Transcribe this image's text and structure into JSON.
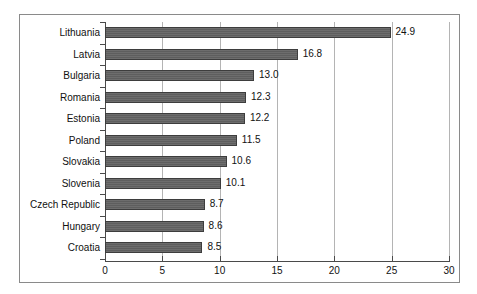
{
  "chart_data": {
    "type": "bar",
    "orientation": "horizontal",
    "title": "",
    "subtitle": "",
    "xlabel": "",
    "ylabel": "",
    "xlim": [
      0,
      30
    ],
    "xticks": [
      "0",
      "5",
      "10",
      "15",
      "20",
      "25",
      "30"
    ],
    "grid": true,
    "legend": null,
    "categories": [
      "Lithuania",
      "Latvia",
      "Bulgaria",
      "Romania",
      "Estonia",
      "Poland",
      "Slovakia",
      "Slovenia",
      "Czech Republic",
      "Hungary",
      "Croatia"
    ],
    "values": [
      24.9,
      16.8,
      13.0,
      12.3,
      12.2,
      11.5,
      10.6,
      10.1,
      8.7,
      8.6,
      8.5
    ],
    "value_labels": [
      "24.9",
      "16.8",
      "13.0",
      "12.3",
      "12.2",
      "11.5",
      "10.6",
      "10.1",
      "8.7",
      "8.6",
      "8.5"
    ],
    "colors": {
      "bar_fill": "#666666",
      "bar_edge": "#3d3d3d",
      "gridline": "#b4b4b4",
      "axis": "#4a4a4a",
      "frame": "#8a8a8a",
      "text": "#111111",
      "background": "#ffffff"
    }
  }
}
